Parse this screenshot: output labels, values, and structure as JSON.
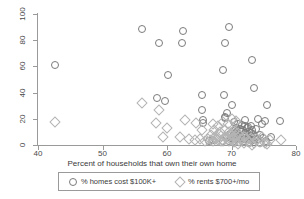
{
  "chart_data": {
    "type": "scatter",
    "title": "",
    "xlabel": "Percent of households that own their own home",
    "ylabel": "",
    "xlim": [
      40,
      80
    ],
    "ylim": [
      0,
      100
    ],
    "xticks": [
      40,
      50,
      60,
      70,
      80
    ],
    "yticks": [
      0,
      20,
      40,
      60,
      80,
      100
    ],
    "grid": "horizontal",
    "legend_position": "below-axis",
    "series": [
      {
        "name": "% homes cost $100K+",
        "marker": "circle",
        "color": "#7b7b7b",
        "points": [
          [
            42.5,
            62.0
          ],
          [
            55.9,
            89.0
          ],
          [
            58.6,
            78.5
          ],
          [
            62.3,
            87.5
          ],
          [
            62.1,
            79.0
          ],
          [
            69.5,
            91.0
          ],
          [
            68.9,
            79.0
          ],
          [
            73.1,
            65.5
          ],
          [
            68.6,
            58.0
          ],
          [
            60.0,
            54.5
          ],
          [
            73.3,
            44.5
          ],
          [
            58.3,
            37.0
          ],
          [
            59.5,
            34.5
          ],
          [
            65.2,
            39.0
          ],
          [
            68.7,
            39.0
          ],
          [
            75.4,
            31.5
          ],
          [
            69.9,
            31.0
          ],
          [
            65.3,
            27.5
          ],
          [
            69.2,
            25.5
          ],
          [
            68.9,
            22.5
          ],
          [
            68.9,
            21.0
          ],
          [
            75.1,
            19.0
          ],
          [
            77.4,
            19.0
          ],
          [
            65.4,
            19.5
          ],
          [
            65.4,
            17.5
          ],
          [
            72.0,
            20.0
          ],
          [
            73.9,
            20.5
          ],
          [
            74.6,
            16.5
          ],
          [
            70.3,
            18.5
          ],
          [
            70.9,
            17.0
          ],
          [
            71.4,
            16.0
          ],
          [
            71.9,
            15.0
          ],
          [
            72.4,
            14.5
          ],
          [
            72.9,
            15.5
          ],
          [
            70.6,
            14.0
          ],
          [
            71.2,
            13.0
          ],
          [
            71.7,
            12.5
          ],
          [
            72.3,
            13.5
          ],
          [
            73.0,
            12.0
          ],
          [
            73.6,
            13.0
          ],
          [
            70.1,
            11.5
          ],
          [
            70.7,
            10.5
          ],
          [
            71.3,
            11.0
          ],
          [
            71.9,
            10.0
          ],
          [
            72.6,
            10.5
          ],
          [
            73.2,
            9.5
          ],
          [
            69.6,
            9.0
          ],
          [
            70.2,
            8.5
          ],
          [
            70.8,
            8.0
          ],
          [
            71.5,
            8.5
          ],
          [
            72.1,
            7.5
          ],
          [
            72.8,
            8.0
          ],
          [
            73.5,
            7.0
          ],
          [
            74.2,
            8.5
          ],
          [
            69.2,
            6.5
          ],
          [
            69.8,
            6.0
          ],
          [
            70.4,
            5.5
          ],
          [
            71.1,
            6.0
          ],
          [
            71.8,
            5.0
          ],
          [
            72.5,
            5.5
          ],
          [
            73.2,
            4.5
          ],
          [
            74.0,
            5.0
          ],
          [
            74.8,
            6.0
          ],
          [
            68.6,
            4.0
          ],
          [
            69.4,
            3.5
          ],
          [
            70.2,
            4.0
          ],
          [
            71.0,
            3.0
          ],
          [
            71.8,
            3.5
          ],
          [
            72.6,
            2.5
          ],
          [
            73.4,
            3.0
          ],
          [
            74.3,
            2.5
          ],
          [
            75.2,
            3.5
          ],
          [
            75.9,
            7.0
          ],
          [
            67.0,
            4.5
          ],
          [
            66.3,
            3.5
          ]
        ]
      },
      {
        "name": "% rents $700+/mo",
        "marker": "diamond",
        "color": "#b4b4b4",
        "points": [
          [
            42.5,
            18.0
          ],
          [
            56.0,
            32.5
          ],
          [
            58.6,
            27.5
          ],
          [
            58.1,
            17.5
          ],
          [
            59.9,
            14.0
          ],
          [
            62.6,
            20.0
          ],
          [
            59.2,
            6.5
          ],
          [
            61.9,
            7.0
          ],
          [
            64.4,
            17.5
          ],
          [
            65.3,
            12.5
          ],
          [
            63.3,
            5.0
          ],
          [
            64.2,
            4.5
          ],
          [
            65.0,
            5.0
          ],
          [
            65.8,
            4.0
          ],
          [
            66.6,
            4.5
          ],
          [
            67.4,
            5.5
          ],
          [
            68.2,
            4.0
          ],
          [
            66.9,
            17.0
          ],
          [
            67.8,
            15.5
          ],
          [
            68.6,
            18.5
          ],
          [
            69.3,
            16.5
          ],
          [
            69.9,
            20.5
          ],
          [
            70.6,
            19.0
          ],
          [
            67.2,
            12.0
          ],
          [
            68.0,
            11.0
          ],
          [
            68.8,
            12.5
          ],
          [
            69.5,
            10.5
          ],
          [
            70.2,
            11.5
          ],
          [
            70.9,
            10.0
          ],
          [
            66.6,
            8.5
          ],
          [
            67.4,
            7.5
          ],
          [
            68.2,
            8.0
          ],
          [
            69.0,
            7.0
          ],
          [
            69.8,
            8.5
          ],
          [
            70.5,
            7.5
          ],
          [
            71.2,
            8.0
          ],
          [
            71.9,
            7.0
          ],
          [
            66.2,
            5.0
          ],
          [
            67.0,
            4.0
          ],
          [
            67.8,
            4.5
          ],
          [
            68.6,
            3.5
          ],
          [
            69.4,
            4.0
          ],
          [
            70.2,
            3.0
          ],
          [
            71.0,
            3.5
          ],
          [
            71.8,
            2.5
          ],
          [
            72.6,
            3.0
          ],
          [
            73.4,
            2.0
          ],
          [
            74.2,
            3.0
          ],
          [
            75.0,
            2.5
          ],
          [
            75.8,
            4.5
          ],
          [
            77.5,
            4.5
          ],
          [
            74.5,
            6.5
          ],
          [
            73.8,
            5.5
          ],
          [
            72.9,
            6.0
          ],
          [
            72.1,
            5.0
          ],
          [
            71.3,
            5.5
          ],
          [
            70.4,
            6.0
          ],
          [
            69.6,
            5.5
          ],
          [
            68.8,
            6.5
          ],
          [
            75.3,
            1.5
          ],
          [
            73.0,
            1.0
          ],
          [
            70.8,
            1.2
          ]
        ]
      }
    ]
  },
  "legend": {
    "entries": [
      {
        "label": "% homes cost $100K+",
        "marker": "circle"
      },
      {
        "label": "% rents $700+/mo",
        "marker": "diamond"
      }
    ]
  }
}
